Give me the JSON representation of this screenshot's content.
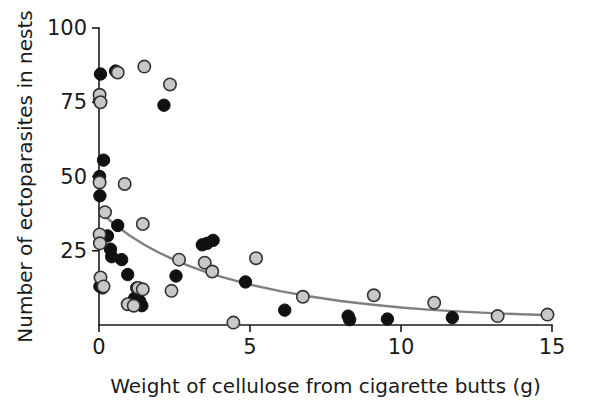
{
  "chart_data": {
    "type": "scatter",
    "title": "",
    "xlabel": "Weight of cellulose from cigarette butts (g)",
    "ylabel": "Number of ectoparasites in nests",
    "xlim": [
      0,
      15
    ],
    "ylim": [
      0,
      100
    ],
    "xticks": [
      0,
      5,
      10,
      15
    ],
    "yticks": [
      25,
      50,
      75,
      100
    ],
    "xtick_labels": [
      "0",
      "5",
      "10",
      "15"
    ],
    "ytick_labels": [
      "25",
      "50",
      "75",
      "100"
    ],
    "grid": false,
    "legend": "none",
    "series": [
      {
        "name": "black-filled-nests",
        "marker": "filled-circle",
        "color": "#111111",
        "edge_color": "#111111",
        "points": [
          [
            0.05,
            84.5
          ],
          [
            0.02,
            75.5
          ],
          [
            0.55,
            85.5
          ],
          [
            2.15,
            74.0
          ],
          [
            0.15,
            55.5
          ],
          [
            0.02,
            50.0
          ],
          [
            0.03,
            43.5
          ],
          [
            0.62,
            33.5
          ],
          [
            0.28,
            30.0
          ],
          [
            0.38,
            25.5
          ],
          [
            0.42,
            23.0
          ],
          [
            0.75,
            22.0
          ],
          [
            0.95,
            17.0
          ],
          [
            1.25,
            12.5
          ],
          [
            1.18,
            9.0
          ],
          [
            1.35,
            8.0
          ],
          [
            1.42,
            6.5
          ],
          [
            0.03,
            13.0
          ],
          [
            0.12,
            12.5
          ],
          [
            2.55,
            16.5
          ],
          [
            3.42,
            27.0
          ],
          [
            3.58,
            27.5
          ],
          [
            3.78,
            28.5
          ],
          [
            4.85,
            14.5
          ],
          [
            6.15,
            5.0
          ],
          [
            8.25,
            3.0
          ],
          [
            8.3,
            1.8
          ],
          [
            9.55,
            2.0
          ],
          [
            11.7,
            2.5
          ]
        ]
      },
      {
        "name": "gray-open-nests",
        "marker": "open-circle",
        "color": "#c8c8c8",
        "edge_color": "#333333",
        "points": [
          [
            0.62,
            85.0
          ],
          [
            1.5,
            87.0
          ],
          [
            2.35,
            81.0
          ],
          [
            0.02,
            77.5
          ],
          [
            0.05,
            75.0
          ],
          [
            0.02,
            48.0
          ],
          [
            0.85,
            47.5
          ],
          [
            0.2,
            38.0
          ],
          [
            1.45,
            34.0
          ],
          [
            0.02,
            30.5
          ],
          [
            0.03,
            27.5
          ],
          [
            2.65,
            22.0
          ],
          [
            3.5,
            21.0
          ],
          [
            5.2,
            22.5
          ],
          [
            3.75,
            18.0
          ],
          [
            0.05,
            16.0
          ],
          [
            0.15,
            13.0
          ],
          [
            1.3,
            12.5
          ],
          [
            1.45,
            12.0
          ],
          [
            2.4,
            11.5
          ],
          [
            0.95,
            7.0
          ],
          [
            1.15,
            6.5
          ],
          [
            6.75,
            9.5
          ],
          [
            9.1,
            10.0
          ],
          [
            11.1,
            7.5
          ],
          [
            4.45,
            0.8
          ],
          [
            13.2,
            3.0
          ],
          [
            14.85,
            3.5
          ]
        ]
      }
    ],
    "fit_curve": {
      "name": "exponential-decay-fit",
      "color": "#808080",
      "line_width": 2.4,
      "equation_points": [
        [
          0.0,
          38.5
        ],
        [
          0.5,
          34.0
        ],
        [
          1.0,
          30.2
        ],
        [
          1.5,
          27.0
        ],
        [
          2.0,
          24.3
        ],
        [
          2.5,
          21.9
        ],
        [
          3.0,
          19.8
        ],
        [
          3.5,
          18.0
        ],
        [
          4.0,
          16.4
        ],
        [
          5.0,
          13.6
        ],
        [
          6.0,
          11.4
        ],
        [
          7.0,
          9.6
        ],
        [
          8.0,
          8.1
        ],
        [
          9.0,
          6.9
        ],
        [
          10.0,
          5.9
        ],
        [
          11.0,
          5.1
        ],
        [
          12.0,
          4.5
        ],
        [
          13.0,
          4.0
        ],
        [
          14.0,
          3.6
        ],
        [
          15.0,
          3.3
        ]
      ]
    }
  },
  "geometry": {
    "x0_px": 99,
    "x15_px": 552,
    "y0_px": 325,
    "y100_px": 28,
    "marker_radius": 6.2
  }
}
